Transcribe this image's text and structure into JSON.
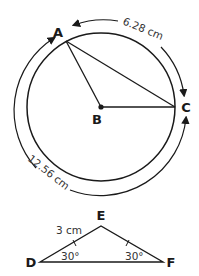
{
  "figure1": {
    "type": "circle",
    "points": {
      "A": "A",
      "B": "B",
      "C": "C"
    },
    "arcs": [
      {
        "from": "A",
        "to": "C",
        "label": "6.28 cm",
        "direction": "clockwise"
      },
      {
        "from": "C",
        "to": "A",
        "label": "12.56 cm",
        "direction": "clockwise-around-bottom"
      }
    ],
    "segments": [
      "AB",
      "BC",
      "AC"
    ],
    "center": "B"
  },
  "figure2": {
    "type": "triangle",
    "vertices": {
      "D": "D",
      "E": "E",
      "F": "F"
    },
    "side_label": "3 cm",
    "angle_D": "30°",
    "angle_F": "30°",
    "tick_marks": [
      "DE",
      "EF"
    ]
  }
}
